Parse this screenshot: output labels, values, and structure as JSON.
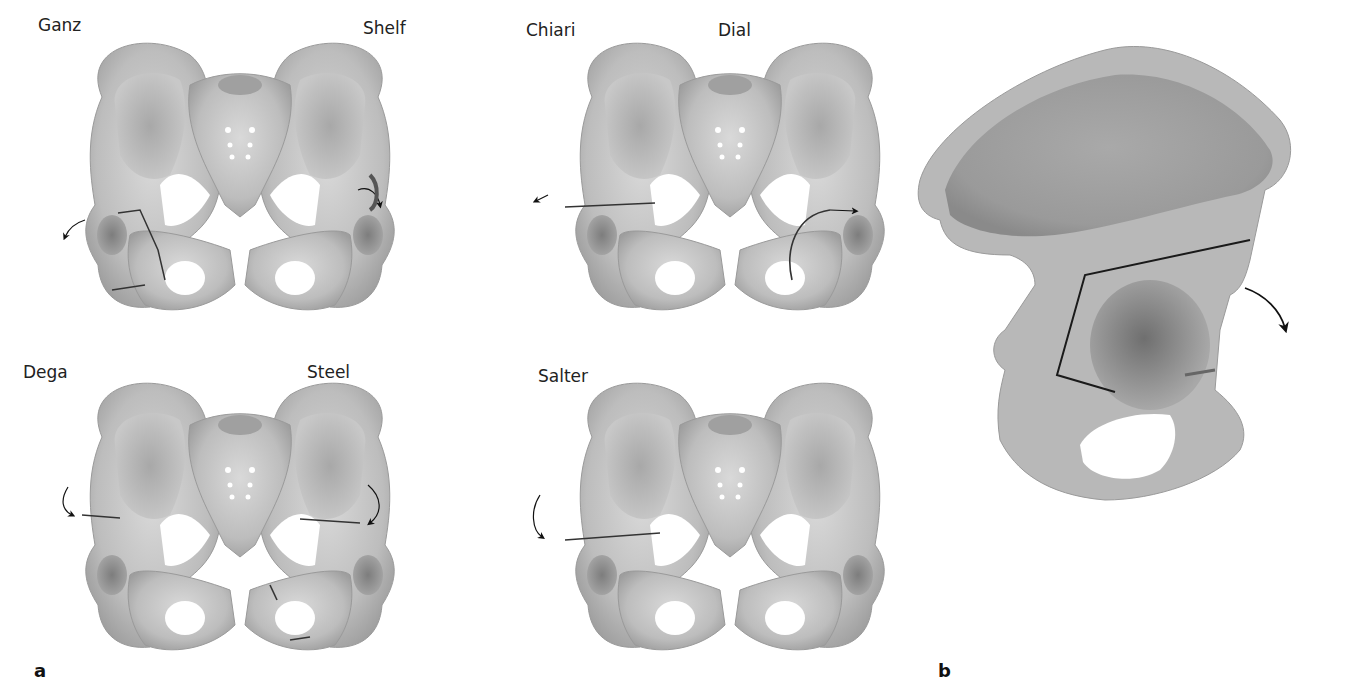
{
  "figure": {
    "panel_a": {
      "letter": "a",
      "pelvis_diagrams": [
        {
          "left_label": "Ganz",
          "right_label": "Shelf"
        },
        {
          "left_label": "Chiari",
          "right_label": "Dial"
        },
        {
          "left_label": "Dega",
          "right_label": "Steel"
        },
        {
          "left_label": "Salter",
          "right_label": ""
        }
      ]
    },
    "panel_b": {
      "letter": "b",
      "description": "Lateral view of hemipelvis with osteotomy line and rotation arrow"
    },
    "colors": {
      "bone_light": "#d6d6d6",
      "bone_mid": "#b4b4b4",
      "bone_dark": "#8c8c8c",
      "cut_line": "#1a1a1a"
    }
  }
}
